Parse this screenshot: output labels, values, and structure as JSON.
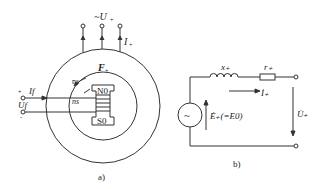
{
  "figure_a": {
    "caption": "a)",
    "terminal_label": "~U̇₊",
    "terminal_label_main": "~U",
    "terminal_sub": "+",
    "current_label": "İ₊",
    "current_main": "I",
    "current_sub": "+",
    "mmf_label": "F₊",
    "mmf_main": "F",
    "mmf_sub": "+",
    "speed_label_outer": "ns",
    "speed_label_inner": "ns",
    "pole_north": "N0",
    "pole_south": "S0",
    "field_current": "If",
    "field_voltage": "Uf",
    "plus_sign": "+",
    "minus_sign": "-"
  },
  "figure_b": {
    "caption": "b)",
    "reactance": "x₊",
    "resistance": "r₊",
    "current": "İ₊",
    "emf": "Ė₊(=E0)",
    "voltage": "U̇₊",
    "source_symbol": "~"
  }
}
